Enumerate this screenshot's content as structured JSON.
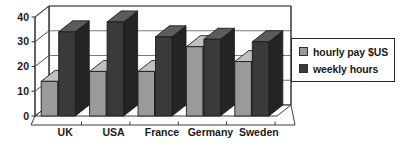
{
  "chart_data": {
    "type": "bar",
    "title": "",
    "xlabel": "",
    "ylabel": "",
    "categories": [
      "UK",
      "USA",
      "France",
      "Germany",
      "Sweden"
    ],
    "series": [
      {
        "name": "hourly pay $US",
        "values": [
          14,
          18,
          18,
          28,
          22
        ],
        "color": "#9a9a9a"
      },
      {
        "name": "weekly hours",
        "values": [
          34,
          38,
          32,
          31,
          30
        ],
        "color": "#3a3a3a"
      }
    ],
    "ylim": [
      0,
      40
    ],
    "yticks": [
      0,
      10,
      20,
      30,
      40
    ],
    "ytick_labels": [
      "0",
      "10",
      "20",
      "30",
      "40"
    ],
    "grid": true,
    "legend_position": "right",
    "style": "3d-column"
  },
  "axis": {
    "y_labels": [
      "40",
      "30",
      "20",
      "10",
      "0"
    ]
  },
  "legend": {
    "items": [
      {
        "label": "hourly pay $US",
        "swatch": "#9a9a9a"
      },
      {
        "label": "weekly hours",
        "swatch": "#3a3a3a"
      }
    ]
  },
  "colors": {
    "series_light": "#9a9a9a",
    "series_light_top": "#c0c0c0",
    "series_light_side": "#6e6e6e",
    "series_dark": "#3a3a3a",
    "series_dark_top": "#5c5c5c",
    "series_dark_side": "#242424",
    "axis_line": "#3d3d3d",
    "grid_line": "#6b6b6b",
    "plot_bg": "#ffffff",
    "text": "#1a1a1a"
  }
}
